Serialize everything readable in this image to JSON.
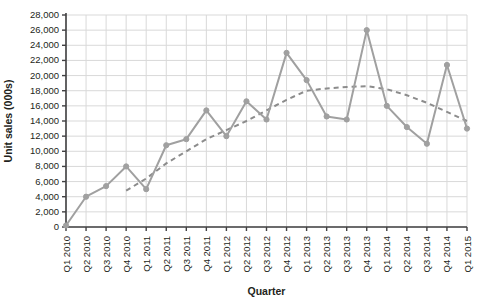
{
  "chart_data": {
    "type": "line",
    "title": "",
    "xlabel": "Quarter",
    "ylabel": "Unit sales (000s)",
    "ylim": [
      0,
      28000
    ],
    "ytick_step": 2000,
    "grid": true,
    "legend": "none",
    "categories": [
      "Q1 2010",
      "Q2 2010",
      "Q3 2010",
      "Q4 2010",
      "Q1 2011",
      "Q2 2011",
      "Q3 2011",
      "Q4 2011",
      "Q1 2012",
      "Q2 2012",
      "Q3 2012",
      "Q4 2012",
      "Q1 2013",
      "Q2 2013",
      "Q3 2013",
      "Q4 2013",
      "Q1 2014",
      "Q2 2014",
      "Q3 2014",
      "Q4 2014",
      "Q1 2015"
    ],
    "ytick_labels": [
      "0",
      "2,000",
      "4,000",
      "6,000",
      "8,000",
      "10,000",
      "12,000",
      "14,000",
      "16,000",
      "18,000",
      "20,000",
      "22,000",
      "24,000",
      "26,000",
      "28,000"
    ],
    "ytick_values": [
      0,
      2000,
      4000,
      6000,
      8000,
      10000,
      12000,
      14000,
      16000,
      18000,
      20000,
      22000,
      24000,
      26000,
      28000
    ],
    "series": [
      {
        "name": "Unit sales",
        "style": "solid-with-markers",
        "color": "#a0a0a0",
        "values": [
          200,
          4000,
          5400,
          8000,
          5000,
          10800,
          11600,
          15400,
          12000,
          16600,
          14200,
          23000,
          19400,
          14600,
          14200,
          26000,
          16000,
          13200,
          11000,
          21400,
          13000
        ]
      },
      {
        "name": "Trend",
        "style": "dashed",
        "color": "#8c8c8c",
        "values": [
          null,
          null,
          null,
          4800,
          6400,
          8400,
          10000,
          11600,
          12800,
          14000,
          15400,
          16800,
          18000,
          18300,
          18500,
          18600,
          18200,
          17400,
          16400,
          15200,
          14000
        ]
      }
    ]
  },
  "colors": {
    "axis": "#414042",
    "grid": "#d9d9d9",
    "line": "#a0a0a0",
    "trend": "#8c8c8c",
    "text": "#231f20",
    "background": "#ffffff"
  }
}
